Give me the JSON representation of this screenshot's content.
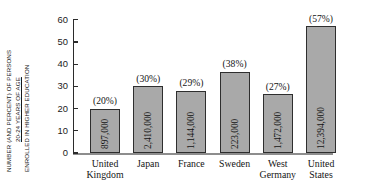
{
  "chart_data": {
    "type": "bar",
    "title": "",
    "subtitle": "",
    "xlabel": "",
    "ylabel": "NUMBER (AND PERCENT) OF PERSONS 20-24 YEARS OF AGE ENROLLED IN HIGHER EDUCATION",
    "ylabel_lines": [
      "NUMBER (AND PERCENT) OF PERSONS",
      "20-24 YEARS OF AGE",
      "ENROLLED IN HIGHER EDUCATION"
    ],
    "ylim": [
      0,
      60
    ],
    "ytick_labels": [
      "60",
      "50",
      "40",
      "30",
      "20",
      "10",
      "0"
    ],
    "yticks": [
      60,
      50,
      40,
      30,
      20,
      10,
      0
    ],
    "grid": false,
    "legend": "none",
    "categories": [
      "United Kingdom",
      "Japan",
      "France",
      "Sweden",
      "West Germany",
      "United States"
    ],
    "category_label_lines": [
      [
        "United",
        "Kingdom"
      ],
      [
        "Japan"
      ],
      [
        "France"
      ],
      [
        "Sweden"
      ],
      [
        "West",
        "Germany"
      ],
      [
        "United",
        "States"
      ]
    ],
    "values": [
      20,
      30,
      28,
      36.5,
      26.5,
      57
    ],
    "percent_labels": [
      "(20%)",
      "(30%)",
      "(29%)",
      "(38%)",
      "(27%)",
      "(57%)"
    ],
    "count_labels": [
      "897,000",
      "2,410,000",
      "1,144,000",
      "223,000",
      "1,472,000",
      "12,394,000"
    ],
    "bar_fill_color": "#a9a9a9",
    "bar_edge_color": "#2e2e2e",
    "axis_color": "#2b2b2b",
    "baseline_color": "#8d8d8d",
    "background_color": "#ffffff"
  }
}
